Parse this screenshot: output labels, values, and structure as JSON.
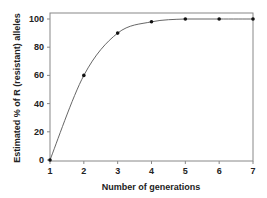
{
  "chart_data": {
    "type": "line",
    "title": "",
    "xlabel": "Number of generations",
    "ylabel": "Estimated % of R (resistant) alleles",
    "x": [
      1,
      2,
      3,
      4,
      5,
      6,
      7
    ],
    "series": [
      {
        "name": "R allele frequency",
        "values": [
          0,
          60,
          90,
          98,
          100,
          100,
          100
        ],
        "marker": "dot",
        "line": "smooth"
      }
    ],
    "xticks": [
      1,
      2,
      3,
      4,
      5,
      6,
      7
    ],
    "yticks": [
      0,
      20,
      40,
      60,
      80,
      100
    ],
    "xlim": [
      1,
      7
    ],
    "ylim": [
      0,
      100
    ],
    "grid": false,
    "legend": null,
    "colors": {
      "line": "#555555",
      "marker": "#111111",
      "axis": "#888888",
      "text": "#222222"
    }
  }
}
